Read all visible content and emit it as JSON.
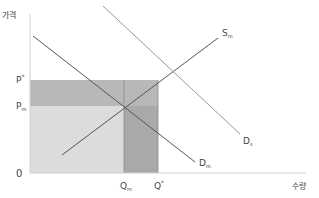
{
  "chart_data": {
    "type": "line",
    "title": "",
    "xlabel": "수량",
    "ylabel": "가격",
    "origin_label": "0",
    "price_ticks": [
      {
        "label": "P*",
        "base": "P",
        "sup": "*",
        "sub": "",
        "y_px": 80
      },
      {
        "label": "Pm",
        "base": "P",
        "sup": "",
        "sub": "m",
        "y_px": 106
      }
    ],
    "quantity_ticks": [
      {
        "label": "Qm",
        "base": "Q",
        "sup": "",
        "sub": "m",
        "x_px": 124
      },
      {
        "label": "Q*",
        "base": "Q",
        "sup": "*",
        "sub": "",
        "x_px": 158
      }
    ],
    "series": [
      {
        "name": "Sm",
        "base": "S",
        "sub": "m",
        "kind": "supply",
        "color": "#555555",
        "points": [
          [
            62,
            155
          ],
          [
            218,
            38
          ]
        ],
        "label_pos": [
          222,
          36
        ]
      },
      {
        "name": "Dm",
        "base": "D",
        "sub": "m",
        "kind": "demand",
        "color": "#555555",
        "points": [
          [
            33,
            36
          ],
          [
            195,
            162
          ]
        ],
        "label_pos": [
          199,
          166
        ]
      },
      {
        "name": "Ds",
        "base": "D",
        "sub": "s",
        "kind": "demand",
        "color": "#9a9a9a",
        "points": [
          [
            103,
            6
          ],
          [
            240,
            134
          ]
        ],
        "label_pos": [
          243,
          144
        ]
      }
    ],
    "regions": [
      {
        "name": "area-0-Qstar-Pm-Pstar",
        "x": [
          30,
          158
        ],
        "y": [
          80,
          106
        ],
        "color": "#b8b8b8"
      },
      {
        "name": "area-0-Qm-0-Pm",
        "x": [
          30,
          124
        ],
        "y": [
          106,
          173
        ],
        "color": "#dcdcdc"
      },
      {
        "name": "area-Qm-Qstar-0-Pm",
        "x": [
          124,
          158
        ],
        "y": [
          106,
          173
        ],
        "color": "#a9a9a9"
      }
    ],
    "axes": {
      "x_origin_px": 30,
      "y_origin_px": 173,
      "x_end_px": 306,
      "y_top_px": 14
    },
    "grid": false,
    "legend": "none"
  }
}
